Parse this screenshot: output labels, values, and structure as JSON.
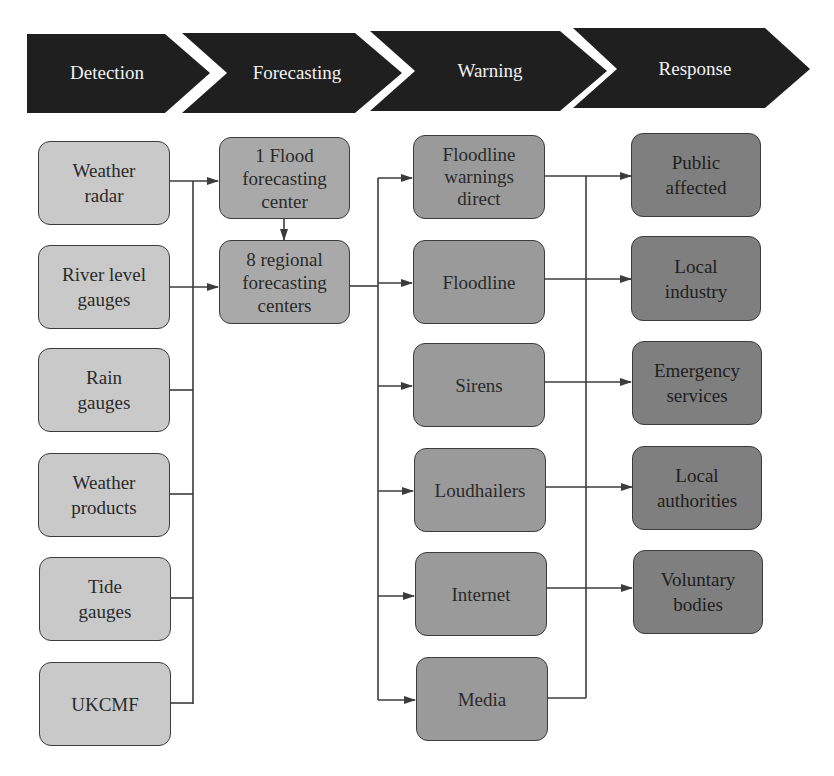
{
  "stages": [
    {
      "label": "Detection"
    },
    {
      "label": "Forecasting"
    },
    {
      "label": "Warning"
    },
    {
      "label": "Response"
    }
  ],
  "detection": [
    {
      "label": "Weather\nradar"
    },
    {
      "label": "River level\ngauges"
    },
    {
      "label": "Rain\ngauges"
    },
    {
      "label": "Weather\nproducts"
    },
    {
      "label": "Tide\ngauges"
    },
    {
      "label": "UKCMF"
    }
  ],
  "forecasting": [
    {
      "label": "1 Flood\nforecasting\ncenter"
    },
    {
      "label": "8 regional\nforecasting\ncenters"
    }
  ],
  "warning": [
    {
      "label": "Floodline\nwarnings\ndirect"
    },
    {
      "label": "Floodline"
    },
    {
      "label": "Sirens"
    },
    {
      "label": "Loudhailers"
    },
    {
      "label": "Internet"
    },
    {
      "label": "Media"
    }
  ],
  "response": [
    {
      "label": "Public\naffected"
    },
    {
      "label": "Local\nindustry"
    },
    {
      "label": "Emergency\nservices"
    },
    {
      "label": "Local\nauthorities"
    },
    {
      "label": "Voluntary\nbodies"
    }
  ],
  "colors": {
    "header": "#1f1f1f",
    "detection_fill": "#c9c9c9",
    "forecasting_fill": "#a9a9a9",
    "warning_fill": "#9a9a9a",
    "response_fill": "#7f7f7f",
    "line": "#3c3c3c"
  }
}
